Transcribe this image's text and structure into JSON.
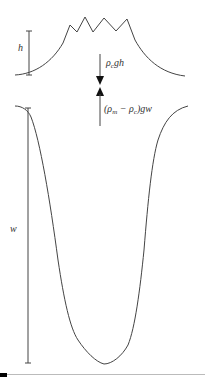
{
  "diagram": {
    "labels": {
      "height": "h",
      "width": "w",
      "crust_load": {
        "rho": "ρ",
        "sub": "c",
        "rest": "gh"
      },
      "buoyancy": {
        "open": "(ρ",
        "sub_m": "m",
        "minus": " − ρ",
        "sub_c": "c",
        "rest": ")gw"
      }
    },
    "colors": {
      "stroke": "#444444",
      "background": "#ffffff"
    }
  }
}
